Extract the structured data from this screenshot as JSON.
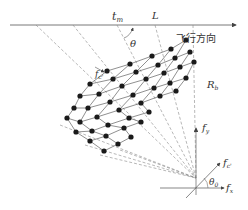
{
  "labels": {
    "t_m": "t",
    "t_m_sub": "m",
    "L": "L",
    "theta": "θ",
    "flight_direction": "飞行方向",
    "R_b": "R",
    "R_b_sub": "b",
    "f_y": "f",
    "f_y_sub": "y",
    "f_x": "f",
    "f_x_sub": "x",
    "f_c": "f",
    "f_c_sub": "c'",
    "theta0": "θ",
    "theta0_sub": "0",
    "f_c_grid": "f",
    "f_c_grid_sub": "c'"
  },
  "colors": {
    "line": "#555555",
    "dash": "#888888",
    "dot": "#1a1a1a",
    "text": "#333333"
  },
  "geometry": {
    "axis_y": 25,
    "origin": [
      196,
      178
    ],
    "grid_rows": [
      [
        [
          107,
          71
        ],
        [
          130,
          64
        ],
        [
          152,
          56
        ],
        [
          171,
          49
        ],
        [
          186,
          40
        ]
      ],
      [
        [
          90,
          84
        ],
        [
          113,
          79
        ],
        [
          136,
          72
        ],
        [
          158,
          65
        ],
        [
          175,
          58
        ],
        [
          190,
          52
        ]
      ],
      [
        [
          80,
          96
        ],
        [
          99,
          94
        ],
        [
          122,
          86
        ],
        [
          146,
          79
        ],
        [
          164,
          73
        ],
        [
          180,
          67
        ],
        [
          194,
          62
        ]
      ],
      [
        [
          74,
          108
        ],
        [
          88,
          108
        ],
        [
          110,
          102
        ],
        [
          133,
          95
        ],
        [
          154,
          88
        ],
        [
          170,
          83
        ],
        [
          186,
          78
        ]
      ],
      [
        [
          67,
          118
        ],
        [
          80,
          122
        ],
        [
          97,
          117
        ],
        [
          119,
          110
        ],
        [
          141,
          103
        ],
        [
          160,
          96
        ],
        [
          176,
          91
        ]
      ],
      [
        [
          76,
          132
        ],
        [
          92,
          131
        ],
        [
          108,
          125
        ],
        [
          129,
          118
        ],
        [
          149,
          112
        ]
      ],
      [
        [
          90,
          141
        ],
        [
          106,
          136
        ],
        [
          124,
          128
        ],
        [
          141,
          122
        ]
      ],
      [
        [
          104,
          151
        ],
        [
          118,
          144
        ],
        [
          131,
          137
        ]
      ]
    ]
  }
}
